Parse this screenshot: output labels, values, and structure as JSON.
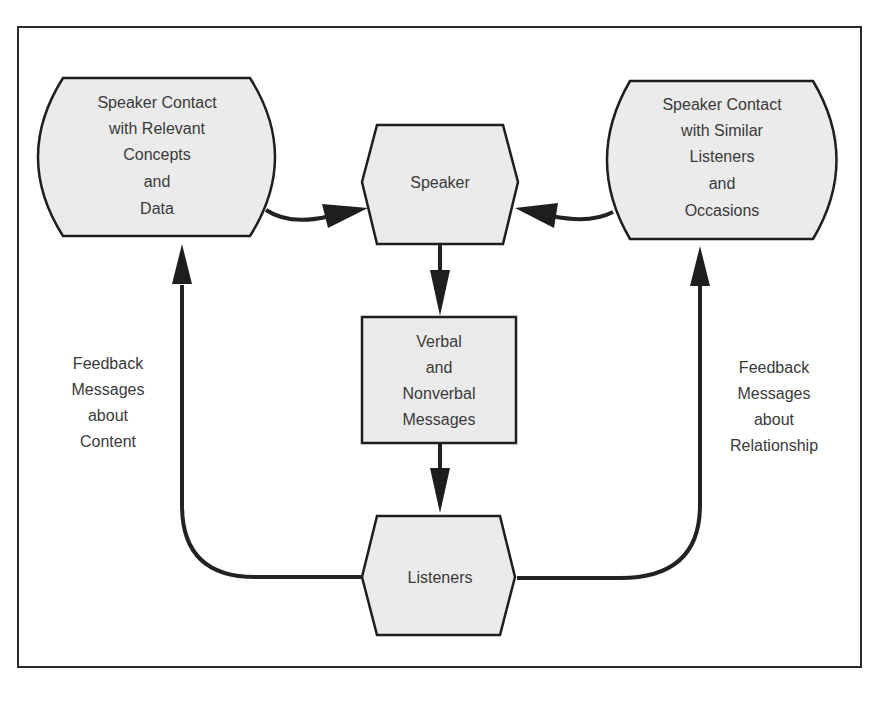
{
  "diagram": {
    "nodes": {
      "concepts": {
        "lines": [
          "Speaker Contact",
          "with Relevant",
          "Concepts",
          "and",
          "Data"
        ]
      },
      "speaker": {
        "lines": [
          "Speaker"
        ]
      },
      "listeners_occasions": {
        "lines": [
          "Speaker Contact",
          "with Similar",
          "Listeners",
          "and",
          "Occasions"
        ]
      },
      "messages": {
        "lines": [
          "Verbal",
          "and",
          "Nonverbal",
          "Messages"
        ]
      },
      "listeners": {
        "lines": [
          "Listeners"
        ]
      }
    },
    "labels": {
      "feedback_content": {
        "lines": [
          "Feedback",
          "Messages",
          "about",
          "Content"
        ]
      },
      "feedback_relationship": {
        "lines": [
          "Feedback",
          "Messages",
          "about",
          "Relationship"
        ]
      }
    },
    "edges": [
      {
        "from": "concepts",
        "to": "speaker"
      },
      {
        "from": "listeners_occasions",
        "to": "speaker"
      },
      {
        "from": "speaker",
        "to": "messages"
      },
      {
        "from": "messages",
        "to": "listeners"
      },
      {
        "from": "listeners",
        "to": "concepts",
        "label": "feedback_content"
      },
      {
        "from": "listeners",
        "to": "listeners_occasions",
        "label": "feedback_relationship"
      }
    ]
  }
}
